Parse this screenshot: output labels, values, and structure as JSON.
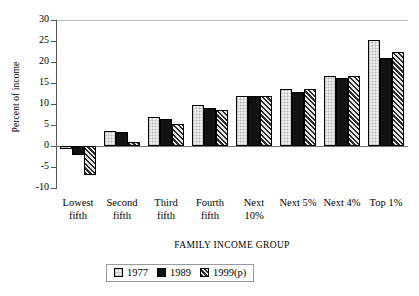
{
  "chart_data": {
    "type": "bar",
    "title": "",
    "xlabel": "FAMILY INCOME GROUP",
    "ylabel": "Percent of income",
    "ylim": [
      -10,
      30
    ],
    "ytick_values": [
      30,
      25,
      20,
      15,
      10,
      5,
      0,
      -5,
      -10
    ],
    "ytick_labels": [
      "30",
      "25",
      "20",
      "15",
      "10",
      "5",
      "0",
      "-5",
      "-10"
    ],
    "grid": false,
    "legend_position": "bottom-center",
    "categories": [
      "Lowest\nfifth",
      "Second\nfifth",
      "Third\nfifth",
      "Fourth\nfifth",
      "Next\n10%",
      "Next 5%",
      "Next 4%",
      "Top 1%"
    ],
    "series": [
      {
        "name": "1977",
        "style": "white",
        "values": [
          -0.6,
          3.6,
          6.9,
          9.8,
          12.0,
          13.6,
          16.6,
          25.2
        ]
      },
      {
        "name": "1989",
        "style": "black",
        "values": [
          -2.2,
          3.3,
          6.4,
          9.1,
          11.8,
          12.8,
          16.2,
          21.0
        ]
      },
      {
        "name": "1999(p)",
        "style": "hatched",
        "values": [
          -7.0,
          1.0,
          5.2,
          8.5,
          11.8,
          13.5,
          16.6,
          22.4
        ]
      }
    ]
  },
  "legend": {
    "items": [
      {
        "label": "1977",
        "style": "white"
      },
      {
        "label": "1989",
        "style": "black"
      },
      {
        "label": "1999(p)",
        "style": "hatched"
      }
    ]
  }
}
